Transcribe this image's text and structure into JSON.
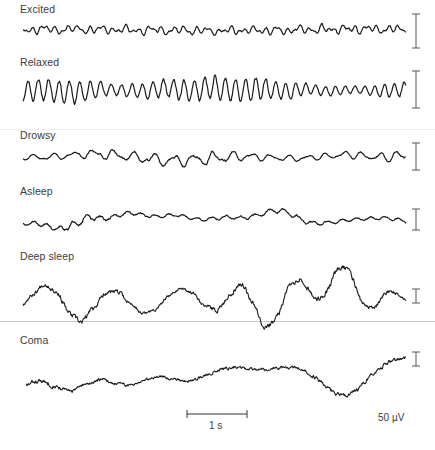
{
  "chart_data": {
    "type": "line",
    "title": "",
    "xlabel": "",
    "ylabel": "",
    "grid": false,
    "legend": "none",
    "series": [
      {
        "name": "Excited",
        "label_y": 9,
        "baseline_y": 30,
        "x_start": 23,
        "x_end": 406,
        "amplitude": 5,
        "scale_bar": {
          "x": 416,
          "y1": 14,
          "y2": 48
        },
        "wave": {
          "components": [
            [
              0.55,
              0.45
            ],
            [
              0.9,
              0.35
            ],
            [
              0.25,
              0.3
            ]
          ],
          "smooth": 1,
          "seed": 11,
          "base_freq": 0.1,
          "slow": 0.15
        }
      },
      {
        "name": "Relaxed",
        "label_y": 62,
        "baseline_y": 90,
        "x_start": 23,
        "x_end": 406,
        "amplitude": 11,
        "scale_bar": {
          "x": 416,
          "y1": 71,
          "y2": 108
        },
        "wave": {
          "components": [
            [
              0.62,
              1.0
            ],
            [
              0.12,
              0.15
            ]
          ],
          "smooth": 1,
          "seed": 23,
          "base_freq": 0.02,
          "slow": 0.1,
          "envelope": [
            0.9,
            1.0,
            0.45,
            0.85,
            1.0,
            0.95,
            0.5,
            0.3,
            0.75
          ]
        }
      },
      {
        "name": "Drowsy",
        "label_y": 135,
        "baseline_y": 157,
        "x_start": 23,
        "x_end": 406,
        "amplitude": 7,
        "scale_bar": {
          "x": 416,
          "y1": 143,
          "y2": 170
        },
        "wave": {
          "components": [
            [
              0.33,
              0.7
            ],
            [
              0.55,
              0.3
            ],
            [
              0.06,
              0.35
            ]
          ],
          "smooth": 1,
          "seed": 37,
          "base_freq": 0.03,
          "slow": 0.3,
          "envelope": [
            0.4,
            0.6,
            0.8,
            1.0,
            1.0,
            0.5,
            0.45,
            0.6,
            0.8
          ]
        }
      },
      {
        "name": "Asleep",
        "label_y": 191,
        "baseline_y": 218,
        "x_start": 23,
        "x_end": 406,
        "amplitude": 9,
        "scale_bar": {
          "x": 416,
          "y1": 209,
          "y2": 230
        },
        "wave": {
          "components": [
            [
              0.05,
              0.8
            ],
            [
              0.45,
              0.35
            ],
            [
              0.12,
              0.3
            ]
          ],
          "smooth": 1,
          "seed": 51,
          "base_freq": 0.02,
          "slow": 0.6,
          "envelope": [
            0.5,
            1.0,
            0.5,
            0.4,
            0.5,
            0.7,
            0.45,
            0.5
          ]
        }
      },
      {
        "name": "Deep sleep",
        "label_y": 256,
        "baseline_y": 298,
        "x_start": 23,
        "x_end": 406,
        "amplitude": 18,
        "scale_bar": {
          "x": 416,
          "y1": 289,
          "y2": 303
        },
        "wave": {
          "components": [
            [
              0.11,
              1.0
            ],
            [
              0.035,
              0.6
            ],
            [
              0.4,
              0.08
            ]
          ],
          "smooth": 1,
          "seed": 67,
          "base_freq": 0.01,
          "slow": 0.5,
          "envelope": [
            0.6,
            1.0,
            0.6,
            0.5,
            1.0,
            1.0,
            0.9,
            0.4
          ]
        }
      },
      {
        "name": "Coma",
        "label_y": 340,
        "baseline_y": 374,
        "x_start": 26,
        "x_end": 406,
        "amplitude": 14,
        "scale_bar": {
          "x": 416,
          "y1": 352,
          "y2": 366
        },
        "wave": {
          "components": [
            [
              0.028,
              1.0
            ],
            [
              0.09,
              0.35
            ],
            [
              0.3,
              0.05
            ]
          ],
          "smooth": 1,
          "seed": 83,
          "base_freq": 0.01,
          "slow": 0.2,
          "envelope": [
            1.0,
            0.8,
            0.6,
            0.7,
            0.6,
            1.0,
            0.9
          ]
        }
      }
    ],
    "dividers": [
      {
        "y": 129,
        "color": "#ededed"
      },
      {
        "y": 321,
        "color": "#c8c8c8"
      }
    ],
    "time_scale": {
      "label": "1 s",
      "x1": 187,
      "x2": 247,
      "y": 414,
      "label_x": 209,
      "label_y": 420
    },
    "amplitude_scale": {
      "label": "50 µV",
      "x": 378,
      "y": 412
    }
  },
  "labels": {
    "excited": "Excited",
    "relaxed": "Relaxed",
    "drowsy": "Drowsy",
    "asleep": "Asleep",
    "deep_sleep": "Deep sleep",
    "coma": "Coma",
    "time_scale": "1 s",
    "amplitude_scale": "50 µV"
  },
  "colors": {
    "trace": "#1a1a1a",
    "scale_bar": "#555555",
    "text": "#3c3c3c"
  }
}
